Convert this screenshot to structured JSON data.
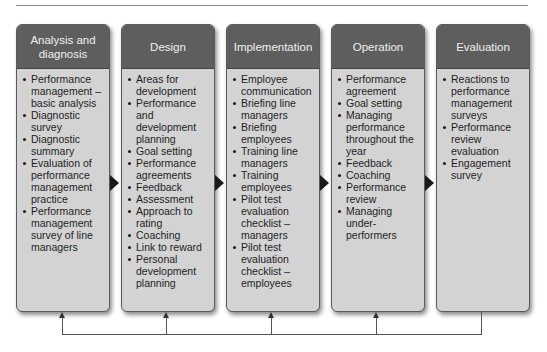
{
  "stages": [
    {
      "title": "Analysis and diagnosis",
      "items": [
        "Performance management – basic analysis",
        "Diagnostic survey",
        "Diagnostic summary",
        "Evaluation of performance management practice",
        "Performance management survey of line managers"
      ]
    },
    {
      "title": "Design",
      "items": [
        "Areas for development",
        "Performance and development planning",
        "Goal setting",
        "Performance agreements",
        "Feedback",
        "Assessment",
        "Approach to rating",
        "Coaching",
        "Link to reward",
        "Personal development planning"
      ]
    },
    {
      "title": "Implementation",
      "items": [
        "Employee communication",
        "Briefing line managers",
        "Briefing employees",
        "Training line managers",
        "Training employees",
        "Pilot test evaluation checklist – managers",
        "Pilot test evaluation checklist – employees"
      ]
    },
    {
      "title": "Operation",
      "items": [
        "Performance agreement",
        "Goal setting",
        "Managing performance throughout the year",
        "Feedback",
        "Coaching",
        "Performance review",
        "Managing under-performers"
      ]
    },
    {
      "title": "Evaluation",
      "items": [
        "Reactions to performance management surveys",
        "Performance review evaluation",
        "Engagement survey"
      ]
    }
  ],
  "colors": {
    "header": "#5e5e5e",
    "body": "#d3d3d3",
    "arrow": "#1a1a1a"
  }
}
